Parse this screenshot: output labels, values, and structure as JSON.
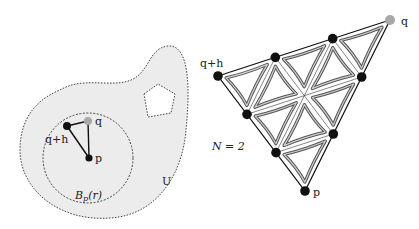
{
  "left_figure": {
    "region_label": "U",
    "ball_label_main": "B",
    "ball_label_sub": "p",
    "ball_label_arg": "(r)",
    "points": {
      "q": "q",
      "q_plus_h": "q+h",
      "p": "p"
    }
  },
  "right_figure": {
    "subdivision_label": "N = 2",
    "subdivision_level": 2,
    "points": {
      "q": "q",
      "q_plus_h": "q+h",
      "p": "p"
    }
  },
  "colors": {
    "region_fill": "#ececec",
    "outline": "#333333",
    "dot": "#111111",
    "q_dot": "#a8a8a8",
    "curve_outer": "#555555",
    "curve_inner": "#cfcfcf"
  }
}
